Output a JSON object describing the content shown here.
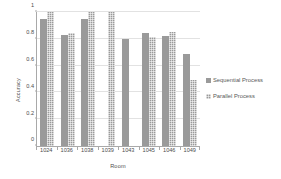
{
  "chart_data": {
    "type": "bar",
    "title": "",
    "xlabel": "Room",
    "ylabel": "Accuracy",
    "ylim": [
      0,
      1
    ],
    "yticks": [
      "0",
      "0.2",
      "0.4",
      "0.6",
      "0.8",
      "1"
    ],
    "ytick_values": [
      0,
      0.2,
      0.4,
      0.6,
      0.8,
      1
    ],
    "grid": true,
    "legend_position": "right",
    "categories": [
      "1024",
      "1036",
      "1038",
      "1039",
      "1043",
      "1045",
      "1046",
      "1049"
    ],
    "series": [
      {
        "name": "Sequential Process",
        "color": "#9a9a9a",
        "pattern": "solid",
        "values": [
          0.95,
          0.83,
          0.95,
          null,
          0.8,
          0.84,
          0.82,
          0.69
        ]
      },
      {
        "name": "Parallel Process",
        "color": "#9a9a9a",
        "pattern": "checker",
        "values": [
          1.0,
          0.84,
          1.0,
          1.0,
          null,
          0.81,
          0.85,
          0.49
        ]
      }
    ]
  },
  "legend": {
    "items": [
      {
        "label": "Sequential Process"
      },
      {
        "label": "Parallel Process"
      }
    ]
  }
}
